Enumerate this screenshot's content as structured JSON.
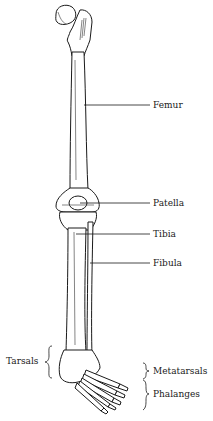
{
  "diagram": {
    "labels": {
      "femur": "Femur",
      "patella": "Patella",
      "tibia": "Tibia",
      "fibula": "Fibula",
      "tarsals": "Tarsals",
      "metatarsals": "Metatarsals",
      "phalanges": "Phalanges"
    },
    "colors": {
      "ink": "#1a1a1a",
      "bone": "#ffffff",
      "shade": "#333333"
    }
  }
}
